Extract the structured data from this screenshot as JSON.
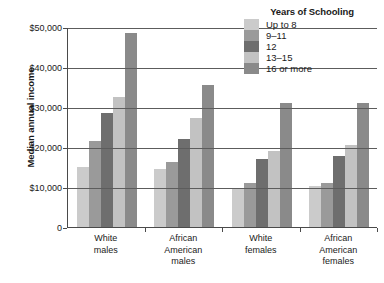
{
  "chart_data": {
    "type": "bar",
    "title": "",
    "xlabel": "",
    "ylabel": "Median annual income",
    "ylim": [
      0,
      50000
    ],
    "grid": true,
    "legend_position": "top-right",
    "legend_title": "Years of Schooling",
    "categories": [
      "White\nmales",
      "African\nAmerican\nmales",
      "White\nfemales",
      "African\nAmerican\nfemales"
    ],
    "ytick_labels": [
      "0",
      "$10,000",
      "$20,000",
      "$30,000",
      "$40,000",
      "$50,000"
    ],
    "ytick_values": [
      0,
      10000,
      20000,
      30000,
      40000,
      50000
    ],
    "series": [
      {
        "name": "Up to 8",
        "color": "#cbcbcb",
        "values": [
          15000,
          14500,
          9500,
          10200
        ]
      },
      {
        "name": "9–11",
        "color": "#9a9a9a",
        "values": [
          21500,
          16200,
          11000,
          11000
        ]
      },
      {
        "name": "12",
        "color": "#6e6e6e",
        "values": [
          28500,
          22000,
          17000,
          17800
        ]
      },
      {
        "name": "13–15",
        "color": "#c2c2c2",
        "values": [
          32500,
          27200,
          19000,
          20500
        ]
      },
      {
        "name": "16 or more",
        "color": "#8a8a8a",
        "values": [
          48500,
          35500,
          31000,
          31000
        ]
      }
    ]
  },
  "axis": {
    "y_title": "Median annual income"
  },
  "legend": {
    "title": "Years of Schooling",
    "items": [
      {
        "label": "Up to 8",
        "color": "#cbcbcb"
      },
      {
        "label": "9–11",
        "color": "#9a9a9a"
      },
      {
        "label": "12",
        "color": "#6e6e6e"
      },
      {
        "label": "13–15",
        "color": "#c2c2c2"
      },
      {
        "label": "16 or more",
        "color": "#8a8a8a"
      }
    ]
  },
  "colors": {
    "axis": "#4a4a4a",
    "gridline": "#5c5c5c",
    "text": "#1a1a1a",
    "background": "#ffffff"
  }
}
